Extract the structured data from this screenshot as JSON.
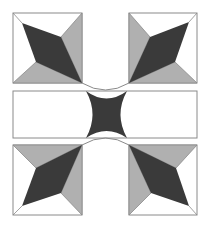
{
  "figure": {
    "colors": {
      "background": "#ffffff",
      "dark": "#3a3a3a",
      "gray": "#b0b0b0",
      "outline": "#8a8a8a"
    },
    "blocks": [
      {
        "name": "top-left-block",
        "x": 13,
        "y": 13,
        "size": 69
      },
      {
        "name": "top-right-block",
        "x": 129,
        "y": 13,
        "size": 68
      },
      {
        "name": "bottom-left-block",
        "x": 13,
        "y": 145,
        "size": 69
      },
      {
        "name": "bottom-right-block",
        "x": 129,
        "y": 145,
        "size": 68
      }
    ],
    "band": {
      "x": 13,
      "y": 91,
      "width": 184,
      "height": 47
    }
  }
}
